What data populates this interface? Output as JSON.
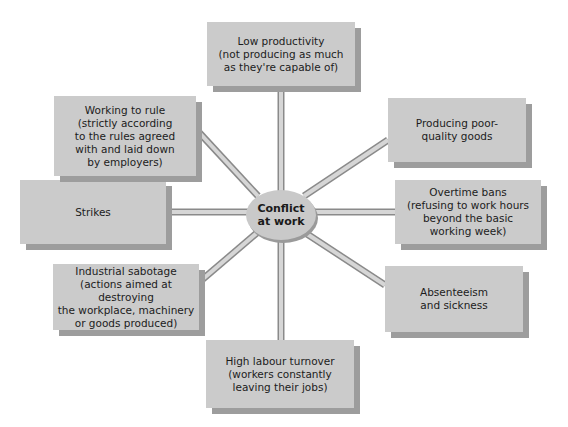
{
  "diagram": {
    "center": {
      "line1": "Conflict",
      "line2": "at work"
    },
    "nodes": [
      {
        "id": "low-productivity",
        "lines": [
          "Low productivity",
          "(not producing as much",
          "as they're capable of)"
        ]
      },
      {
        "id": "poor-quality",
        "lines": [
          "Producing poor-",
          "quality goods"
        ]
      },
      {
        "id": "overtime-bans",
        "lines": [
          "Overtime bans",
          "(refusing to work hours",
          "beyond the basic",
          "working week)"
        ]
      },
      {
        "id": "absenteeism",
        "lines": [
          "Absenteeism",
          "and sickness"
        ]
      },
      {
        "id": "labour-turnover",
        "lines": [
          "High labour turnover",
          "(workers constantly",
          "leaving their jobs)"
        ]
      },
      {
        "id": "sabotage",
        "lines": [
          "Industrial sabotage",
          "(actions aimed at destroying",
          "the workplace, machinery",
          "or goods produced)"
        ]
      },
      {
        "id": "strikes",
        "lines": [
          "Strikes"
        ]
      },
      {
        "id": "working-to-rule",
        "lines": [
          "Working to rule",
          "(strictly according",
          "to the rules agreed",
          "with and laid down",
          "by employers)"
        ]
      }
    ],
    "colors": {
      "box_fill": "#cbcbcb",
      "box_shadow": "#9d9d9d",
      "connector_fill": "#d6d6d6",
      "connector_outline": "#8a8a8a"
    }
  }
}
